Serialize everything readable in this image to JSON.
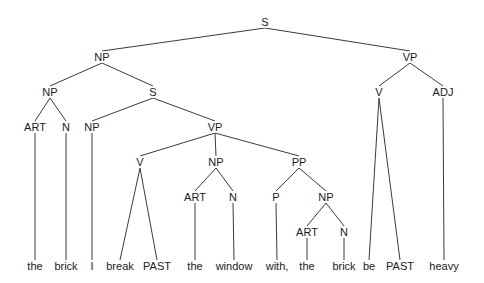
{
  "diagram": {
    "type": "syntax-tree",
    "sentence": [
      "the",
      "brick",
      "I",
      "break",
      "PAST",
      "the",
      "window",
      "with,",
      "the",
      "brick",
      "be",
      "PAST",
      "heavy"
    ],
    "line_color": "#3a3a3a",
    "nodes": [
      {
        "id": "n0",
        "label": "S",
        "x": 265,
        "y": 22
      },
      {
        "id": "n1",
        "label": "NP",
        "x": 102,
        "y": 57,
        "parent": "n0"
      },
      {
        "id": "n2",
        "label": "VP",
        "x": 410,
        "y": 57,
        "parent": "n0"
      },
      {
        "id": "n3",
        "label": "NP",
        "x": 50,
        "y": 92,
        "parent": "n1"
      },
      {
        "id": "n4",
        "label": "S",
        "x": 153,
        "y": 92,
        "parent": "n1"
      },
      {
        "id": "n5",
        "label": "V",
        "x": 379,
        "y": 92,
        "parent": "n2"
      },
      {
        "id": "n6",
        "label": "ADJ",
        "x": 443,
        "y": 92,
        "parent": "n2"
      },
      {
        "id": "n7",
        "label": "ART",
        "x": 35,
        "y": 127,
        "parent": "n3"
      },
      {
        "id": "n8",
        "label": "N",
        "x": 66,
        "y": 127,
        "parent": "n3"
      },
      {
        "id": "n9",
        "label": "NP",
        "x": 92,
        "y": 127,
        "parent": "n4"
      },
      {
        "id": "n10",
        "label": "VP",
        "x": 215,
        "y": 127,
        "parent": "n4"
      },
      {
        "id": "n11",
        "label": "V",
        "x": 140,
        "y": 162,
        "parent": "n10"
      },
      {
        "id": "n12",
        "label": "NP",
        "x": 216,
        "y": 162,
        "parent": "n10"
      },
      {
        "id": "n13",
        "label": "PP",
        "x": 299,
        "y": 162,
        "parent": "n10"
      },
      {
        "id": "n14",
        "label": "ART",
        "x": 195,
        "y": 197,
        "parent": "n12"
      },
      {
        "id": "n15",
        "label": "N",
        "x": 233,
        "y": 197,
        "parent": "n12"
      },
      {
        "id": "n16",
        "label": "P",
        "x": 276,
        "y": 197,
        "parent": "n13"
      },
      {
        "id": "n17",
        "label": "NP",
        "x": 326,
        "y": 197,
        "parent": "n13"
      },
      {
        "id": "n18",
        "label": "ART",
        "x": 307,
        "y": 232,
        "parent": "n17"
      },
      {
        "id": "n19",
        "label": "N",
        "x": 344,
        "y": 232,
        "parent": "n17"
      },
      {
        "id": "l0",
        "label": "the",
        "x": 35,
        "y": 266,
        "parent": "n7",
        "leaf": true
      },
      {
        "id": "l1",
        "label": "brick",
        "x": 66,
        "y": 266,
        "parent": "n8",
        "leaf": true
      },
      {
        "id": "l2",
        "label": "I",
        "x": 92,
        "y": 266,
        "parent": "n9",
        "leaf": true
      },
      {
        "id": "l3",
        "label": "break",
        "x": 120,
        "y": 266,
        "parent": "n11",
        "leaf": true
      },
      {
        "id": "l4",
        "label": "PAST",
        "x": 157,
        "y": 266,
        "parent": "n11",
        "leaf": true
      },
      {
        "id": "l5",
        "label": "the",
        "x": 195,
        "y": 266,
        "parent": "n14",
        "leaf": true
      },
      {
        "id": "l6",
        "label": "window",
        "x": 234,
        "y": 266,
        "parent": "n15",
        "leaf": true
      },
      {
        "id": "l7",
        "label": "with,",
        "x": 277,
        "y": 266,
        "parent": "n16",
        "leaf": true
      },
      {
        "id": "l8",
        "label": "the",
        "x": 307,
        "y": 266,
        "parent": "n18",
        "leaf": true
      },
      {
        "id": "l9",
        "label": "brick",
        "x": 344,
        "y": 266,
        "parent": "n19",
        "leaf": true
      },
      {
        "id": "l10",
        "label": "be",
        "x": 369,
        "y": 266,
        "parent": "n5",
        "leaf": true
      },
      {
        "id": "l11",
        "label": "PAST",
        "x": 400,
        "y": 266,
        "parent": "n5",
        "leaf": true
      },
      {
        "id": "l12",
        "label": "heavy",
        "x": 444,
        "y": 266,
        "parent": "n6",
        "leaf": true
      }
    ]
  }
}
